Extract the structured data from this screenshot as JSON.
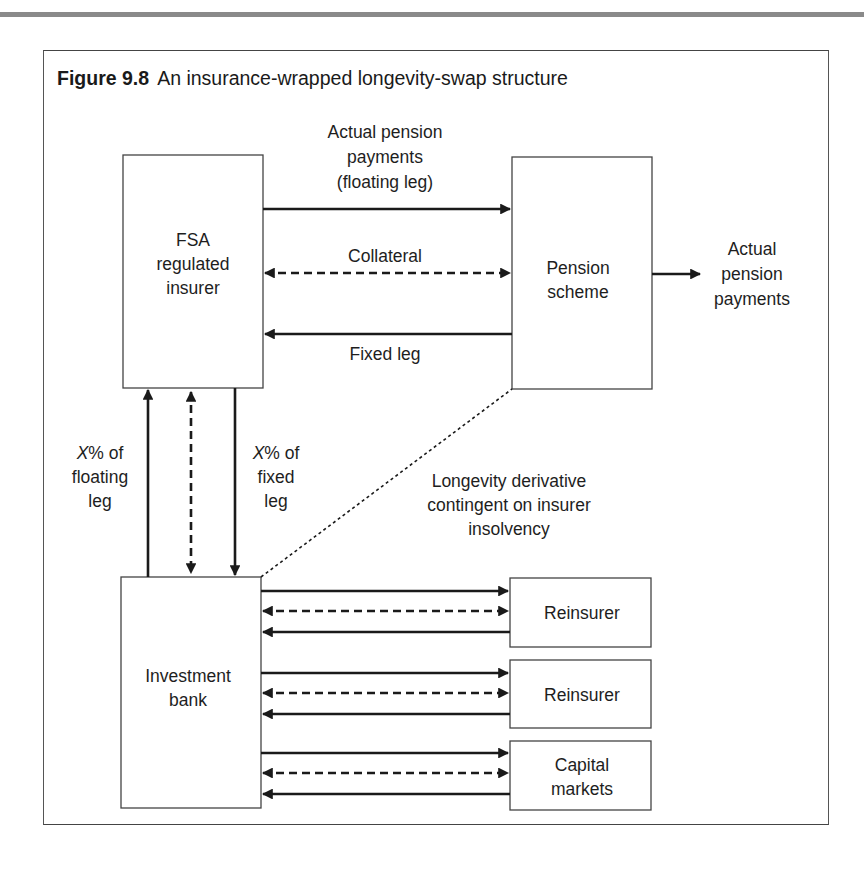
{
  "figure": {
    "number": "Figure 9.8",
    "title": "An insurance-wrapped longevity-swap structure"
  },
  "nodes": {
    "insurer": [
      "FSA",
      "regulated",
      "insurer"
    ],
    "pension_scheme": [
      "Pension",
      "scheme"
    ],
    "investment_bank": [
      "Investment",
      "bank"
    ],
    "reinsurer_1": [
      "Reinsurer"
    ],
    "reinsurer_2": [
      "Reinsurer"
    ],
    "capital_markets": [
      "Capital",
      "markets"
    ]
  },
  "edge_labels": {
    "floating_leg": [
      "Actual pension",
      "payments",
      "(floating leg)"
    ],
    "collateral": "Collateral",
    "fixed_leg": "Fixed leg",
    "pension_out": [
      "Actual",
      "pension",
      "payments"
    ],
    "x_floating": [
      "% of",
      "floating",
      "leg"
    ],
    "x_fixed": [
      "% of",
      "fixed",
      "leg"
    ],
    "x_var": "X",
    "derivative": [
      "Longevity derivative",
      "contingent on insurer",
      "insolvency"
    ]
  },
  "colors": {
    "line": "#1a1a1a",
    "rule": "#8a8a8a",
    "frame": "#555555"
  }
}
